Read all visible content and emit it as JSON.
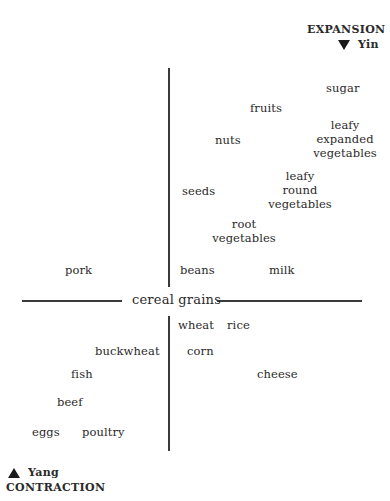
{
  "diagram": {
    "top_right": {
      "title": "EXPANSION",
      "subtitle": "Yin",
      "icon": "triangle-down-icon"
    },
    "bottom_left": {
      "subtitle": "Yang",
      "title": "CONTRACTION",
      "icon": "triangle-up-icon"
    },
    "center_label": "cereal grains",
    "upper_items": {
      "sugar": "sugar",
      "fruits": "fruits",
      "nuts": "nuts",
      "leafy_expanded": [
        "leafy",
        "expanded",
        "vegetables"
      ],
      "seeds": "seeds",
      "leafy_round": [
        "leafy",
        "round",
        "vegetables"
      ],
      "root": [
        "root",
        "vegetables"
      ],
      "pork": "pork",
      "beans": "beans",
      "milk": "milk"
    },
    "lower_items": {
      "wheat": "wheat",
      "rice": "rice",
      "buckwheat": "buckwheat",
      "corn": "corn",
      "fish": "fish",
      "cheese": "cheese",
      "beef": "beef",
      "eggs": "eggs",
      "poultry": "poultry"
    }
  }
}
